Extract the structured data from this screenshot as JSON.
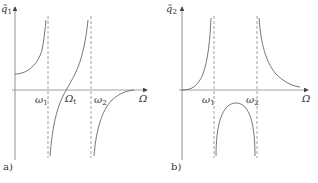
{
  "panels": [
    {
      "id": "a",
      "tag": "a)",
      "y_axis_label": {
        "symbol": "q̃",
        "sub": "1"
      },
      "x_axis_label": "Ω",
      "markers": [
        {
          "symbol": "ω",
          "sub": "1",
          "type": "resonance"
        },
        {
          "symbol": "Ω",
          "sub": "t",
          "type": "zero-crossing"
        },
        {
          "symbol": "ω",
          "sub": "2",
          "type": "resonance"
        }
      ]
    },
    {
      "id": "b",
      "tag": "b)",
      "y_axis_label": {
        "symbol": "q̃",
        "sub": "2"
      },
      "x_axis_label": "Ω",
      "markers": [
        {
          "symbol": "ω",
          "sub": "1",
          "type": "resonance"
        },
        {
          "symbol": "ω",
          "sub": "2",
          "type": "resonance"
        }
      ]
    }
  ],
  "colors": {
    "curve": "#555555",
    "axis": "#666666",
    "dashed": "#777777",
    "text": "#333333"
  }
}
